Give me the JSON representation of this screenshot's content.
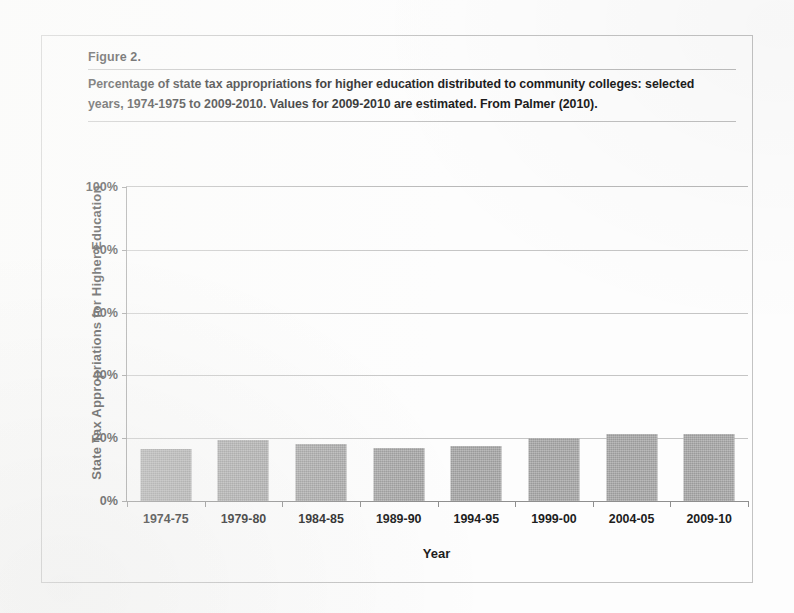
{
  "figure": {
    "label": "Figure 2.",
    "caption": "Percentage of state tax appropriations for higher education distributed to community colleges: selected years, 1974-1975 to 2009-2010. Values for 2009-2010 are estimated. From Palmer (2010).",
    "frame_color": "#c3c3c3",
    "rule_color": "#bdbdbd"
  },
  "chart_data": {
    "type": "bar",
    "title": "",
    "xlabel": "Year",
    "ylabel": "State Tax Appropriations for Higher Education",
    "categories": [
      "1974-75",
      "1979-80",
      "1984-85",
      "1989-90",
      "1994-95",
      "1999-00",
      "2004-05",
      "2009-10"
    ],
    "values": [
      16.5,
      19.5,
      18.0,
      17.0,
      17.5,
      20.0,
      21.3,
      21.3
    ],
    "ylim": [
      0,
      100
    ],
    "ytick_labels": [
      "0%",
      "20%",
      "40%",
      "60%",
      "80%",
      "100%"
    ],
    "ytick_values": [
      0,
      20,
      40,
      60,
      80,
      100
    ],
    "grid": true,
    "legend": false,
    "bar_color": "#a9a9a9",
    "axis_color": "#8f8f8f",
    "gridline_color": "#c5c5c5"
  }
}
